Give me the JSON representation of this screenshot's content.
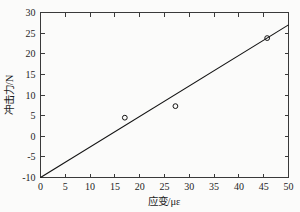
{
  "chart_data": {
    "type": "scatter",
    "title": "",
    "xlabel": "应变/με",
    "ylabel": "冲击力/N",
    "xlim": [
      0,
      50
    ],
    "ylim": [
      -10,
      30
    ],
    "xticks": [
      0,
      5,
      10,
      15,
      20,
      25,
      30,
      35,
      40,
      45,
      50
    ],
    "yticks": [
      -10,
      -5,
      0,
      5,
      10,
      15,
      20,
      25,
      30
    ],
    "xtick_labels": [
      "0",
      "5",
      "10",
      "15",
      "20",
      "25",
      "30",
      "35",
      "40",
      "45",
      "50"
    ],
    "ytick_labels": [
      "-10",
      "-5",
      "0",
      "5",
      "10",
      "15",
      "20",
      "25",
      "30"
    ],
    "grid": false,
    "legend": null,
    "marker_style": "open-circle",
    "series": [
      {
        "name": "测量点",
        "type": "scatter",
        "marker": "o",
        "color": "#141414",
        "points": [
          {
            "x": 17.0,
            "y": 4.5
          },
          {
            "x": 27.2,
            "y": 7.3
          },
          {
            "x": 45.7,
            "y": 23.8
          }
        ]
      },
      {
        "name": "拟合直线",
        "type": "line",
        "color": "#141414",
        "endpoints": [
          {
            "x": 0.0,
            "y": -10.0
          },
          {
            "x": 50.0,
            "y": 27.0
          }
        ],
        "slope": 0.74,
        "intercept": -10.0
      }
    ]
  },
  "figure": {
    "background": "#fbfbfa",
    "axis_color": "#3a3a3a",
    "data_color": "#141414"
  }
}
